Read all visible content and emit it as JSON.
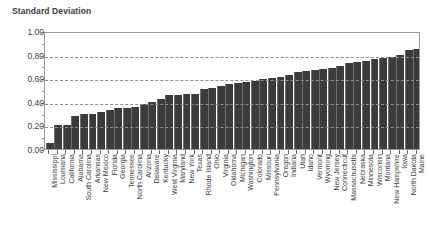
{
  "chart_data": {
    "type": "bar",
    "title": "Standard Deviation",
    "xlabel": "",
    "ylabel": "",
    "ylim": [
      0.0,
      1.0
    ],
    "ytick_step": 0.2,
    "grid": true,
    "grid_style": "dashed-horizontal",
    "legend": null,
    "bar_color": "#3b3b3b",
    "sorted": "ascending",
    "ytick_labels": [
      "0.00",
      "0.20",
      "0.40",
      "0.60",
      "0.80",
      "1.00"
    ],
    "ytick_values": [
      0.0,
      0.2,
      0.4,
      0.6,
      0.8,
      1.0
    ],
    "categories": [
      "Mississippi",
      "Louisiana",
      "California",
      "Alabama",
      "South Carolina",
      "Arkansas",
      "New Mexico",
      "Florida",
      "Georgia",
      "Tennessee",
      "North Carolina",
      "Arizona",
      "Delaware",
      "Kentucky",
      "West Virginia",
      "Maryland",
      "New York",
      "Texas",
      "Rhode Island",
      "Ohio",
      "Virginia",
      "Oklahoma",
      "Michigan",
      "Washington",
      "Colorado",
      "Missouri",
      "Pennsylvania",
      "Oregon",
      "Indiana",
      "Utah",
      "Idaho",
      "Vermont",
      "Wyoming",
      "New Jersey",
      "Connecticut",
      "Massachusetts",
      "Nebraska",
      "Minnesota",
      "Wisconsin",
      "Montana",
      "New Hampshire",
      "Iowa",
      "North Dakota",
      "Maine"
    ],
    "values": [
      0.05,
      0.2,
      0.2,
      0.28,
      0.3,
      0.3,
      0.31,
      0.33,
      0.35,
      0.35,
      0.36,
      0.38,
      0.4,
      0.42,
      0.46,
      0.46,
      0.47,
      0.47,
      0.51,
      0.52,
      0.53,
      0.55,
      0.56,
      0.57,
      0.58,
      0.59,
      0.6,
      0.61,
      0.63,
      0.65,
      0.66,
      0.67,
      0.68,
      0.69,
      0.7,
      0.73,
      0.74,
      0.75,
      0.76,
      0.77,
      0.78,
      0.8,
      0.84,
      0.85
    ]
  }
}
